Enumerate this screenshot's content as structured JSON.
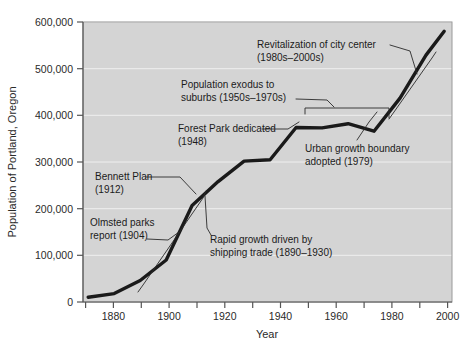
{
  "chart_data": {
    "type": "line",
    "title": "",
    "xlabel": "Year",
    "ylabel": "Population of Portland, Oregon",
    "xlim": [
      1868,
      2010
    ],
    "ylim": [
      0,
      600000
    ],
    "grid": true,
    "legend": "none",
    "x_ticks": [
      1880,
      1900,
      1920,
      1940,
      1960,
      1980,
      2000
    ],
    "x_tick_labels": [
      "1880",
      "1900",
      "1920",
      "1940",
      "1960",
      "1980",
      "2000"
    ],
    "x_minor_ticks": [
      1870,
      1890,
      1910,
      1930,
      1950,
      1970,
      1990,
      2010
    ],
    "y_ticks": [
      0,
      100000,
      200000,
      300000,
      400000,
      500000,
      600000
    ],
    "y_tick_labels": [
      "0",
      "100,000",
      "200,000",
      "300,000",
      "400,000",
      "500,000",
      "600,000"
    ],
    "series": [
      {
        "name": "Population of Portland, Oregon",
        "x": [
          1870,
          1880,
          1890,
          1900,
          1910,
          1920,
          1930,
          1940,
          1950,
          1960,
          1970,
          1980,
          1990,
          2000,
          2007
        ],
        "values": [
          10000,
          18000,
          46000,
          90000,
          207000,
          258000,
          302000,
          305000,
          374000,
          373000,
          382000,
          366000,
          437000,
          529000,
          580000
        ]
      }
    ],
    "annotations": [
      {
        "id": "revitalization",
        "text_lines": [
          "Revitalization of city center",
          "(1980s–2000s)"
        ],
        "period": "1980s–2000s"
      },
      {
        "id": "population-exodus",
        "text_lines": [
          "Population exodus to",
          "suburbs (1950s–1970s)"
        ],
        "period": "1950s–1970s"
      },
      {
        "id": "forest-park",
        "text_lines": [
          "Forest Park dedicated",
          "(1948)"
        ],
        "period": "1948"
      },
      {
        "id": "urban-growth-boundary",
        "text_lines": [
          "Urban growth boundary",
          "adopted (1979)"
        ],
        "period": "1979"
      },
      {
        "id": "bennett-plan",
        "text_lines": [
          "Bennett Plan",
          "(1912)"
        ],
        "period": "1912"
      },
      {
        "id": "olmsted-parks",
        "text_lines": [
          "Olmsted parks",
          "report (1904)"
        ],
        "period": "1904"
      },
      {
        "id": "rapid-growth",
        "text_lines": [
          "Rapid growth driven by",
          "shipping trade (1890–1930)"
        ],
        "period": "1890–1930"
      }
    ],
    "colors": {
      "plot_background": "#d4d4d4",
      "line": "#1a1a1a",
      "gridline": "#efefef",
      "axis": "#555555",
      "text": "#1b1b1b"
    }
  }
}
